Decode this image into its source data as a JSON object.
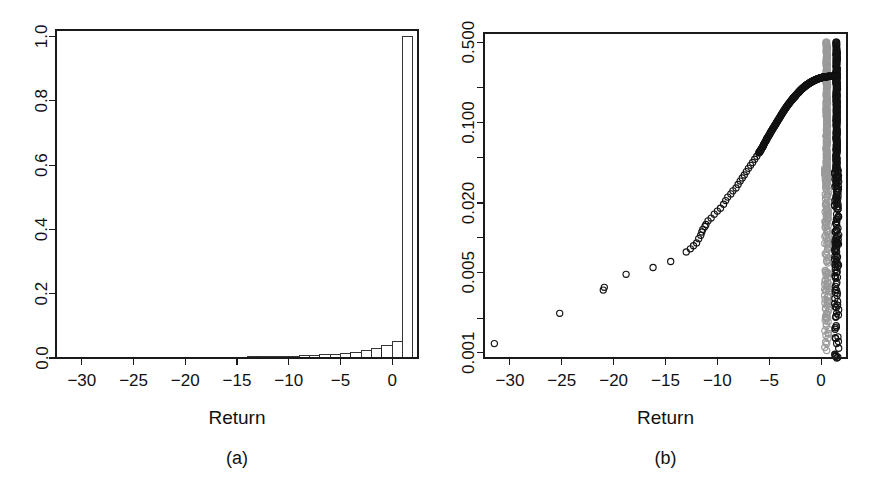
{
  "figure": {
    "title": "",
    "panels": [
      "a",
      "b"
    ]
  },
  "panel_a": {
    "caption": "(a)",
    "xlabel": "Return",
    "ylabel": "",
    "x_ticks": [
      "-30",
      "-25",
      "-20",
      "-15",
      "-10",
      "-5",
      "0"
    ],
    "y_ticks": [
      "0.0",
      "0.2",
      "0.4",
      "0.6",
      "0.8",
      "1.0"
    ]
  },
  "panel_b": {
    "caption": "(b)",
    "xlabel": "Return",
    "ylabel": "",
    "x_ticks": [
      "-30",
      "-25",
      "-20",
      "-15",
      "-10",
      "-5",
      "0"
    ],
    "y_ticks": [
      "0.001",
      "0.005",
      "0.020",
      "0.100",
      "0.500"
    ]
  },
  "colors": {
    "axis": "#1a1a1a",
    "text": "#111111",
    "bar_fill": "#ffffff",
    "bar_stroke": "#1f1f1f",
    "series_black": "#121212",
    "series_gray": "#9a9a9a",
    "background": "#ffffff"
  },
  "chart_data": [
    {
      "id": "panel_a",
      "type": "bar",
      "title": "",
      "subtitle": "",
      "caption": "(a)",
      "xlabel": "Return",
      "ylabel": "",
      "xlim": [
        -32.5,
        2.5
      ],
      "ylim": [
        0.0,
        1.02
      ],
      "xticks": [
        -30,
        -25,
        -20,
        -15,
        -10,
        -5,
        0
      ],
      "yticks": [
        0.0,
        0.2,
        0.4,
        0.6,
        0.8,
        1.0
      ],
      "grid": false,
      "legend": "none",
      "bar_width": 1.0,
      "note": "Histogram of returns (relative frequency); almost all mass in the bin just above 0.",
      "categories": [
        -31.5,
        -30.5,
        -29.5,
        -28.5,
        -27.5,
        -26.5,
        -25.5,
        -24.5,
        -23.5,
        -22.5,
        -21.5,
        -20.5,
        -19.5,
        -18.5,
        -17.5,
        -16.5,
        -15.5,
        -14.5,
        -13.5,
        -12.5,
        -11.5,
        -10.5,
        -9.5,
        -8.5,
        -7.5,
        -6.5,
        -5.5,
        -4.5,
        -3.5,
        -2.5,
        -1.5,
        -0.5,
        0.5,
        1.5
      ],
      "values": [
        0.001,
        0.0,
        0.0,
        0.0,
        0.0,
        0.0,
        0.001,
        0.0,
        0.0,
        0.0,
        0.002,
        0.001,
        0.0,
        0.002,
        0.0,
        0.003,
        0.0,
        0.003,
        0.004,
        0.004,
        0.005,
        0.005,
        0.006,
        0.007,
        0.008,
        0.01,
        0.012,
        0.014,
        0.018,
        0.022,
        0.03,
        0.04,
        0.05,
        1.0
      ]
    },
    {
      "id": "panel_b",
      "type": "scatter",
      "title": "",
      "subtitle": "",
      "caption": "(b)",
      "xlabel": "Return",
      "ylabel": "",
      "xlim": [
        -32.5,
        2.5
      ],
      "yscale": "log",
      "ylim": [
        0.0009,
        0.6
      ],
      "xticks": [
        -30,
        -25,
        -20,
        -15,
        -10,
        -5,
        0
      ],
      "yticks": [
        0.001,
        0.002,
        0.005,
        0.01,
        0.02,
        0.05,
        0.1,
        0.2,
        0.5
      ],
      "ytick_labels": [
        "0.001",
        "",
        "0.005",
        "",
        "0.020",
        "",
        "0.100",
        "",
        "0.500"
      ],
      "grid": false,
      "legend": "none",
      "marker": "open-circle",
      "note": "Log-scale tail plot: exceedance probability versus return; black series is the empirical tail, gray series is a second (shifted) sample. Two dense near-vertical columns sit at about x = 0.5 (gray) and x = 1.5 (black).",
      "series": [
        {
          "name": "black",
          "color": "#121212",
          "x": [
            -31.5,
            -25.2,
            -21.0,
            -20.9,
            -18.8,
            -16.2,
            -14.5,
            -13.0,
            -12.6,
            -12.3,
            -12.0,
            -11.8,
            -11.6,
            -11.5,
            -11.4,
            -11.2,
            -11.1,
            -10.9,
            -10.6,
            -10.3,
            -10.0,
            -9.7,
            -9.4,
            -9.2,
            -9.0,
            -8.7,
            -8.5,
            -8.2,
            -8.0,
            -7.8,
            -7.6,
            -7.4,
            -7.2,
            -7.0,
            -6.8,
            -6.6,
            -6.4,
            -6.2,
            -6.0,
            -5.9,
            -5.8,
            -5.6,
            -5.5,
            -5.3,
            -5.2,
            -5.0,
            -4.8,
            -4.6,
            -4.4,
            -4.2,
            -4.0,
            -3.8,
            -3.6,
            -3.4,
            -3.2,
            -3.0,
            -2.8,
            -2.6,
            -2.4,
            -2.2,
            -2.0,
            -1.8,
            -1.6,
            -1.4,
            -1.2,
            -1.0,
            -0.8,
            -0.6,
            -0.4,
            -0.2,
            0.0,
            0.2,
            0.4,
            0.6,
            0.8,
            1.0,
            1.2,
            1.4,
            1.5
          ],
          "y": [
            0.0012,
            0.0022,
            0.0035,
            0.0037,
            0.0048,
            0.0055,
            0.0062,
            0.0075,
            0.008,
            0.0085,
            0.009,
            0.0098,
            0.0105,
            0.0112,
            0.0118,
            0.0125,
            0.013,
            0.014,
            0.0148,
            0.016,
            0.017,
            0.018,
            0.0195,
            0.021,
            0.0225,
            0.024,
            0.0255,
            0.027,
            0.029,
            0.031,
            0.033,
            0.035,
            0.0375,
            0.04,
            0.0425,
            0.045,
            0.048,
            0.051,
            0.0545,
            0.056,
            0.058,
            0.062,
            0.065,
            0.07,
            0.073,
            0.078,
            0.084,
            0.09,
            0.096,
            0.103,
            0.11,
            0.118,
            0.126,
            0.134,
            0.142,
            0.15,
            0.158,
            0.166,
            0.174,
            0.182,
            0.19,
            0.198,
            0.205,
            0.212,
            0.218,
            0.224,
            0.229,
            0.234,
            0.238,
            0.242,
            0.245,
            0.248,
            0.25,
            0.251,
            0.252,
            0.252,
            0.252,
            0.252,
            0.252
          ],
          "column_x": 1.5,
          "column_y": [
            0.0012,
            0.0022,
            0.0035,
            0.005,
            0.0062,
            0.0075,
            0.0088,
            0.01,
            0.0115,
            0.013,
            0.0145,
            0.016,
            0.018,
            0.02,
            0.0225,
            0.025,
            0.028,
            0.031,
            0.035,
            0.039,
            0.044,
            0.049,
            0.055,
            0.062,
            0.07,
            0.079,
            0.089,
            0.1,
            0.113,
            0.127,
            0.143,
            0.161,
            0.181,
            0.204,
            0.23,
            0.259,
            0.291,
            0.328,
            0.369,
            0.415,
            0.467,
            0.5
          ]
        },
        {
          "name": "gray",
          "color": "#9a9a9a",
          "column_x": 0.55,
          "column_y": [
            0.0012,
            0.0022,
            0.0035,
            0.005,
            0.0062,
            0.0075,
            0.0088,
            0.01,
            0.0115,
            0.013,
            0.0145,
            0.016,
            0.018,
            0.02,
            0.0225,
            0.025,
            0.028,
            0.031,
            0.035,
            0.039,
            0.044,
            0.049,
            0.055,
            0.062,
            0.07,
            0.079,
            0.089,
            0.1,
            0.113,
            0.127,
            0.143,
            0.161,
            0.181,
            0.204,
            0.23,
            0.259,
            0.291,
            0.328,
            0.369,
            0.415,
            0.467,
            0.5
          ]
        }
      ]
    }
  ]
}
